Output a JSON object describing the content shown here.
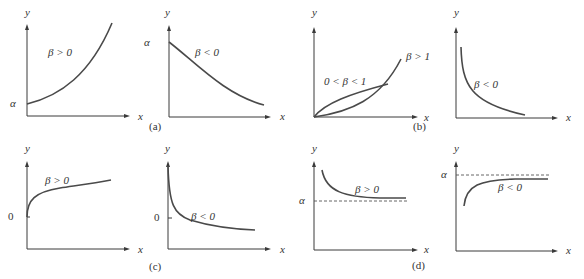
{
  "figure": {
    "panels": [
      {
        "id": "a1",
        "group": "a",
        "y_label": "y",
        "x_label": "x",
        "intercept_label": "α",
        "curve_label": "β > 0"
      },
      {
        "id": "a2",
        "group": "a",
        "y_label": "y",
        "x_label": "x",
        "intercept_label": "α",
        "curve_label": "β < 0",
        "caption": "(a)"
      },
      {
        "id": "b1",
        "group": "b",
        "y_label": "y",
        "x_label": "x",
        "curve_labels": [
          "β > 1",
          "0 < β < 1"
        ],
        "caption": "(b)"
      },
      {
        "id": "b2",
        "group": "b",
        "y_label": "y",
        "x_label": "x",
        "curve_label": "β < 0"
      },
      {
        "id": "c1",
        "group": "c",
        "y_label": "y",
        "x_label": "x",
        "intercept_label": "0",
        "curve_label": "β > 0"
      },
      {
        "id": "c2",
        "group": "c",
        "y_label": "y",
        "x_label": "x",
        "intercept_label": "0",
        "curve_label": "β < 0",
        "caption": "(c)"
      },
      {
        "id": "d1",
        "group": "d",
        "y_label": "y",
        "x_label": "x",
        "asymptote_label": "α",
        "curve_label": "β > 0",
        "caption": "(d)"
      },
      {
        "id": "d2",
        "group": "d",
        "y_label": "y",
        "x_label": "x",
        "asymptote_label": "α",
        "curve_label": "β < 0"
      }
    ]
  }
}
